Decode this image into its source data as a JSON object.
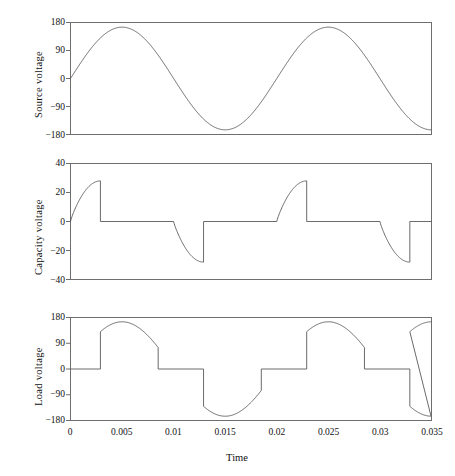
{
  "figure": {
    "xlabel": "Time",
    "background": "#ffffff",
    "line_color": "#5a5a5a",
    "frame_color": "#6e6e6e"
  },
  "chart_data": [
    {
      "type": "line",
      "title": "",
      "ylabel": "Source voltage",
      "xlabel": "",
      "xlim": [
        0,
        0.035
      ],
      "ylim": [
        -180,
        180
      ],
      "yticks": [
        180,
        90,
        0,
        -90,
        -180
      ],
      "ytick_labels": [
        "180",
        "90",
        "0",
        "−90",
        "−180"
      ],
      "xticks": [
        0,
        0.005,
        0.01,
        0.015,
        0.02,
        0.025,
        0.03,
        0.035
      ],
      "xtick_labels": [
        "",
        "",
        "",
        "",
        "",
        "",
        "",
        ""
      ],
      "grid": false,
      "legend": "none",
      "description": "Sinusoidal mains source voltage, 50 Hz, peak amplitude 165 V",
      "waveform": "sine",
      "amplitude": 165,
      "frequency_hz": 50,
      "phase_deg": 0,
      "series": [
        {
          "name": "Source voltage",
          "x": [
            0,
            0.00125,
            0.0025,
            0.005,
            0.0075,
            0.01,
            0.0125,
            0.015,
            0.0175,
            0.02,
            0.0225,
            0.025,
            0.0275,
            0.03,
            0.0325,
            0.035
          ],
          "values": [
            0,
            117,
            165,
            0,
            -165,
            0,
            165,
            0,
            -165,
            0,
            165,
            0,
            -165,
            0,
            165,
            117
          ]
        }
      ]
    },
    {
      "type": "line",
      "title": "",
      "ylabel": "Capacity voltage",
      "xlabel": "",
      "xlim": [
        0,
        0.035
      ],
      "ylim": [
        -40,
        40
      ],
      "yticks": [
        40,
        20,
        0,
        -20,
        -40
      ],
      "ytick_labels": [
        "40",
        "20",
        "0",
        "−20",
        "−40"
      ],
      "xticks": [
        0,
        0.005,
        0.01,
        0.015,
        0.02,
        0.025,
        0.03,
        0.035
      ],
      "xtick_labels": [
        "",
        "",
        "",
        "",
        "",
        "",
        "",
        ""
      ],
      "grid": false,
      "legend": "none",
      "description": "Capacitor voltage: charges to +28 V, abruptly discharges to 0, holds, then charges negative to -28 V and resets to 0, repeating each half cycle",
      "waveform": "charge-discharge sawtooth",
      "positive_peak": 28,
      "negative_peak": -28,
      "series": [
        {
          "name": "Capacity voltage",
          "x": [
            0,
            0.001,
            0.002,
            0.0029,
            0.00295,
            0.006,
            0.0073,
            0.0085,
            0.01,
            0.0112,
            0.01125,
            0.014,
            0.018,
            0.0192,
            0.0202,
            0.02025,
            0.025,
            0.0262,
            0.0275,
            0.0288,
            0.02885,
            0.032,
            0.035
          ],
          "values": [
            2,
            16,
            25,
            28,
            0,
            0,
            0,
            0,
            -16,
            -28,
            0,
            0,
            0,
            14,
            28,
            0,
            0,
            0,
            -14,
            -28,
            0,
            0,
            0
          ]
        }
      ]
    },
    {
      "type": "line",
      "title": "",
      "ylabel": "Load voltage",
      "xlabel": "Time",
      "xlim": [
        0,
        0.035
      ],
      "ylim": [
        -180,
        180
      ],
      "yticks": [
        180,
        90,
        0,
        -90,
        -180
      ],
      "ytick_labels": [
        "180",
        "90",
        "0",
        "−90",
        "−180"
      ],
      "xticks": [
        0,
        0.005,
        0.01,
        0.015,
        0.02,
        0.025,
        0.03,
        0.035
      ],
      "xtick_labels": [
        "0",
        "0.005",
        "0.01",
        "0.015",
        "0.02",
        "0.025",
        "0.03",
        "0.035"
      ],
      "grid": false,
      "legend": "none",
      "description": "Phase-controlled load voltage: zero until firing angle, then follows the source sinusoid to peak 165 V, returns to zero, repeats with negative polarity",
      "waveform": "chopped sine",
      "positive_peak": 165,
      "negative_peak": -165,
      "series": [
        {
          "name": "Load voltage",
          "x": [
            0,
            0.0029,
            0.00295,
            0.004,
            0.005,
            0.0065,
            0.008,
            0.0085,
            0.0112,
            0.01125,
            0.0125,
            0.014,
            0.0155,
            0.0168,
            0.017,
            0.0197,
            0.01975,
            0.021,
            0.0225,
            0.024,
            0.025,
            0.028,
            0.02805,
            0.0295,
            0.031,
            0.0325,
            0.035
          ],
          "values": [
            0,
            0,
            150,
            165,
            160,
            110,
            20,
            0,
            0,
            -150,
            -165,
            -150,
            -100,
            -20,
            0,
            0,
            150,
            165,
            150,
            60,
            0,
            0,
            -150,
            -165,
            -130,
            -60,
            92
          ]
        }
      ]
    }
  ]
}
